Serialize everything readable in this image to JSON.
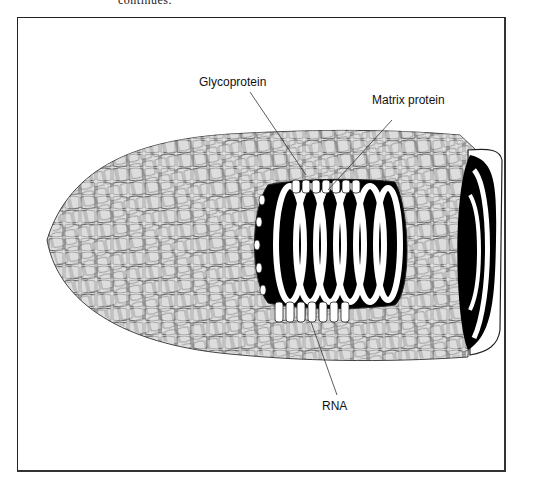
{
  "page": {
    "top_caption_fragment": "continues."
  },
  "figure": {
    "labels": {
      "glycoprotein": "Glycoprotein",
      "matrix_protein": "Matrix protein",
      "rna": "RNA"
    },
    "colors": {
      "envelope_fill": "#dcdcdc",
      "envelope_stroke": "#444444",
      "core": "#000000",
      "coil": "#ffffff",
      "frame": "#222222"
    }
  }
}
